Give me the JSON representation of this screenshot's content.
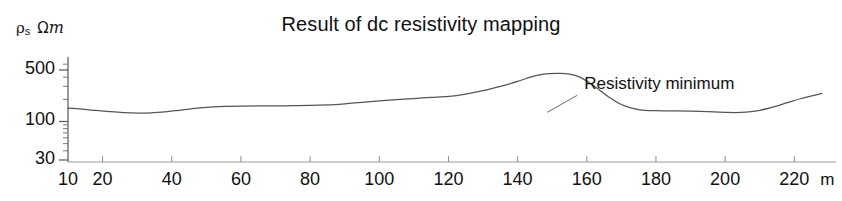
{
  "chart_data": {
    "type": "line",
    "title": "Result of dc resistivity mapping",
    "xlabel": "",
    "ylabel": "ρs Ωm",
    "ylabel_parts": {
      "symbol": "ρ",
      "subscript": "s",
      "unit_omega": "Ω",
      "unit_m": "m"
    },
    "x_unit": "m",
    "yscale": "log",
    "xscale": "linear",
    "xlim": [
      10,
      228
    ],
    "ylim": [
      30,
      700
    ],
    "grid": false,
    "legend": false,
    "x_tick_labels": [
      "10",
      "20",
      "40",
      "60",
      "80",
      "100",
      "120",
      "140",
      "160",
      "180",
      "200",
      "220"
    ],
    "x_ticks": [
      10,
      20,
      40,
      60,
      80,
      100,
      120,
      140,
      160,
      180,
      200,
      220
    ],
    "y_tick_labels": [
      "500",
      "100",
      "30"
    ],
    "y_ticks": [
      500,
      100,
      30
    ],
    "y_minor_ticks": [
      40,
      50,
      60,
      70,
      80,
      90,
      200,
      300,
      400,
      600
    ],
    "annotations": [
      {
        "text": "Resistivity minimum",
        "x": 187,
        "y": 300
      }
    ],
    "series": [
      {
        "name": "apparent resistivity",
        "color": "#555555",
        "x": [
          10,
          14,
          18,
          22,
          26,
          30,
          34,
          38,
          42,
          46,
          50,
          55,
          60,
          65,
          70,
          75,
          80,
          85,
          90,
          95,
          100,
          105,
          110,
          115,
          120,
          125,
          130,
          135,
          140,
          143,
          146,
          149,
          152,
          155,
          158,
          161,
          164,
          167,
          170,
          173,
          176,
          180,
          185,
          190,
          195,
          200,
          203,
          206,
          210,
          214,
          218,
          222,
          226,
          228
        ],
        "y": [
          152,
          147,
          141,
          136,
          132,
          130,
          131,
          135,
          142,
          150,
          156,
          160,
          162,
          163,
          163,
          164,
          165,
          168,
          174,
          182,
          190,
          198,
          205,
          212,
          219,
          236,
          262,
          300,
          350,
          390,
          425,
          445,
          450,
          440,
          400,
          330,
          260,
          205,
          170,
          152,
          143,
          140,
          139,
          138,
          136,
          133,
          132,
          134,
          142,
          158,
          180,
          205,
          228,
          240
        ]
      }
    ]
  }
}
